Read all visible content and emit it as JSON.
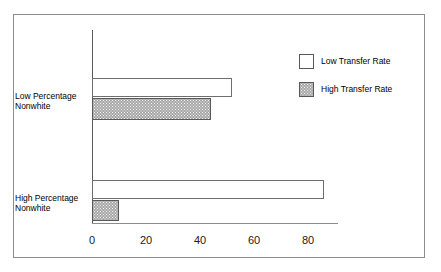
{
  "chart_data": {
    "type": "bar",
    "orientation": "horizontal",
    "title": "",
    "xlabel": "",
    "ylabel": "",
    "categories": [
      "Low Percentage\nNonwhite",
      "High Percentage\nNonwhite"
    ],
    "series": [
      {
        "name": "Low Transfer Rate",
        "values": [
          52,
          86
        ],
        "swatch": "white"
      },
      {
        "name": "High Transfer Rate",
        "values": [
          44,
          10
        ],
        "swatch": "gray-stipple"
      }
    ],
    "xlim": [
      0,
      91
    ],
    "xticks": [
      0,
      20,
      40,
      60,
      80
    ],
    "xtick_labels": [
      "0",
      "20",
      "40",
      "60",
      "80"
    ],
    "grid": false,
    "legend_position": "top-right",
    "colors": {
      "low_transfer_rate": "#ffffff",
      "high_transfer_rate": "#a8a8a8",
      "bar_outline": "#6e6e6e",
      "axis": "#8c8c8c",
      "frame": "#8c8c8c",
      "text": "#000000"
    }
  },
  "legend": {
    "items": [
      {
        "label": "Low Transfer Rate"
      },
      {
        "label": "High Transfer Rate"
      }
    ]
  }
}
